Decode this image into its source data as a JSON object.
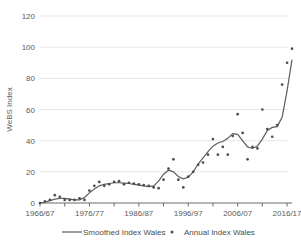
{
  "chart_data": {
    "type": "line",
    "title": "",
    "xlabel": "",
    "ylabel": "WeBS Index",
    "ylim": [
      0,
      120
    ],
    "yticks": [
      0,
      20,
      40,
      60,
      80,
      100,
      120
    ],
    "ytick_labels": [
      "0",
      "20",
      "40",
      "60",
      "80",
      "100",
      "120"
    ],
    "xtick_labels": [
      "1966/67",
      "1976/77",
      "1986/87",
      "1996/97",
      "2006/07",
      "2016/17"
    ],
    "xtick_years": [
      1966,
      1976,
      1986,
      1996,
      2006,
      2016
    ],
    "x_start_year": 1966,
    "x_end_year": 2017,
    "grid": true,
    "legend_position": "bottom",
    "series": [
      {
        "name": "Smoothed Index Wales",
        "render": "line",
        "color": "#5c5c5c",
        "x": [
          1966,
          1967,
          1968,
          1969,
          1970,
          1971,
          1972,
          1973,
          1974,
          1975,
          1976,
          1977,
          1978,
          1979,
          1980,
          1981,
          1982,
          1983,
          1984,
          1985,
          1986,
          1987,
          1988,
          1989,
          1990,
          1991,
          1992,
          1993,
          1994,
          1995,
          1996,
          1997,
          1998,
          1999,
          2000,
          2001,
          2002,
          2003,
          2004,
          2005,
          2006,
          2007,
          2008,
          2009,
          2010,
          2011,
          2012,
          2013,
          2014,
          2015,
          2016,
          2017
        ],
        "values": [
          0,
          0.5,
          1.5,
          2.5,
          3.0,
          3.0,
          2.5,
          2.0,
          2.0,
          3.5,
          6.5,
          9.0,
          11.0,
          12.0,
          12.5,
          13.0,
          13.0,
          12.8,
          12.5,
          12.0,
          11.5,
          11.0,
          10.5,
          11.0,
          14.0,
          18.5,
          21.0,
          20.0,
          17.0,
          15.5,
          16.5,
          20.0,
          25.0,
          29.0,
          33.0,
          36.5,
          38.5,
          39.5,
          41.5,
          44.5,
          44.0,
          40.0,
          36.0,
          35.0,
          36.5,
          41.0,
          46.5,
          48.5,
          49.0,
          55.0,
          72.0,
          92.0
        ]
      },
      {
        "name": "Annual Index Wales",
        "render": "scatter",
        "color": "#4d4d4d",
        "x": [
          1966,
          1967,
          1968,
          1969,
          1970,
          1971,
          1972,
          1973,
          1974,
          1975,
          1976,
          1977,
          1978,
          1979,
          1980,
          1981,
          1982,
          1983,
          1984,
          1985,
          1986,
          1987,
          1988,
          1989,
          1990,
          1991,
          1992,
          1993,
          1994,
          1995,
          1996,
          1997,
          1998,
          1999,
          2000,
          2001,
          2002,
          2003,
          2004,
          2005,
          2006,
          2007,
          2008,
          2009,
          2010,
          2011,
          2012,
          2013,
          2014,
          2015,
          2016,
          2017
        ],
        "values": [
          0,
          1,
          2,
          5,
          4,
          2,
          2,
          2,
          3,
          2,
          8,
          11,
          13.5,
          11,
          12,
          13.5,
          14,
          12,
          13,
          12.5,
          12,
          11.5,
          11,
          10,
          9.5,
          15,
          22,
          28,
          15,
          10,
          17,
          20,
          24.5,
          26,
          31,
          41,
          31,
          36,
          31,
          43,
          57,
          45,
          28,
          36,
          35,
          60,
          47.5,
          42.5,
          50,
          76,
          90,
          99
        ]
      }
    ]
  },
  "legend": {
    "items": [
      {
        "label": "Smoothed Index Wales",
        "marker": "line"
      },
      {
        "label": "Annual Index Wales",
        "marker": "dot"
      }
    ]
  },
  "axes": {
    "y_axis_title": "WeBS Index"
  }
}
